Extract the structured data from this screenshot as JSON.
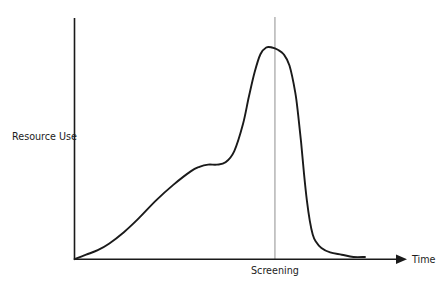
{
  "chart_data": {
    "type": "line",
    "title": "",
    "subtitle": "",
    "xlabel": "Time",
    "ylabel": "Resource Use",
    "grid": false,
    "legend": null,
    "axes": {
      "x_axis_arrow": true,
      "y_axis_arrow": false,
      "x_ticks_shown": false,
      "y_ticks_shown": false,
      "xlim": [
        0,
        100
      ],
      "ylim": [
        0,
        100
      ]
    },
    "annotations": [
      {
        "name": "screening-marker",
        "label": "Screening",
        "x": 69,
        "type": "vertical-reference-line",
        "color": "#9a9a9a",
        "label_position": "below-axis"
      }
    ],
    "series": [
      {
        "name": "Resource Use",
        "color": "#1a1a1a",
        "x": [
          0,
          4,
          8,
          12,
          17,
          22,
          28,
          34,
          40,
          43,
          46,
          49,
          52,
          55,
          58,
          60,
          62,
          64,
          66,
          68,
          70,
          72,
          74,
          76,
          77,
          78,
          79,
          80,
          81,
          82,
          83,
          85,
          88,
          92,
          96,
          100
        ],
        "y": [
          0,
          2,
          4,
          7,
          12,
          18,
          26,
          33,
          39,
          41,
          42,
          42,
          43,
          48,
          60,
          72,
          83,
          91,
          94,
          94,
          93,
          91,
          86,
          74,
          64,
          52,
          38,
          26,
          17,
          11,
          8,
          5,
          3,
          2,
          1,
          1
        ]
      }
    ]
  },
  "labels": {
    "y_axis": "Resource Use",
    "x_axis": "Time",
    "screening": "Screening"
  },
  "colors": {
    "curve": "#1a1a1a",
    "axis": "#1a1a1a",
    "reference_line": "#9a9a9a",
    "text": "#1c1c1c",
    "background": "#ffffff"
  }
}
